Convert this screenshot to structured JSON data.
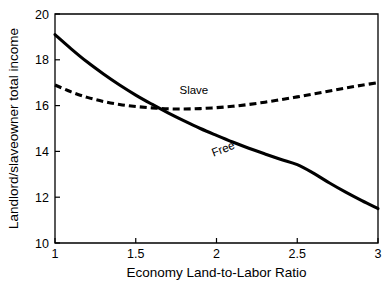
{
  "chart_data": {
    "type": "line",
    "title": "",
    "xlabel": "Economy Land-to-Labor Ratio",
    "ylabel": "Landlord/slaveowner total income",
    "xlim": [
      1,
      3
    ],
    "ylim": [
      10,
      20
    ],
    "xticks": [
      1,
      1.5,
      2,
      2.5,
      3
    ],
    "xticklabels": [
      "1",
      "1.5",
      "2",
      "2.5",
      "3"
    ],
    "yticks": [
      10,
      12,
      14,
      16,
      18,
      20
    ],
    "yticklabels": [
      "10",
      "12",
      "14",
      "16",
      "18",
      "20"
    ],
    "grid": false,
    "legend": "inline-annotations",
    "x": [
      1.0,
      1.1,
      1.2,
      1.3,
      1.4,
      1.5,
      1.6,
      1.7,
      1.8,
      1.9,
      2.0,
      2.1,
      2.2,
      2.3,
      2.4,
      2.5,
      2.6,
      2.7,
      2.8,
      2.9,
      3.0
    ],
    "series": [
      {
        "name": "Free",
        "style": "solid",
        "color": "#000000",
        "label_x": 2.05,
        "label_y": 13.95,
        "label_rotation": -21,
        "values": [
          19.1,
          18.48,
          17.9,
          17.38,
          16.9,
          16.46,
          16.06,
          15.68,
          15.33,
          15.0,
          14.7,
          14.41,
          14.14,
          13.89,
          13.65,
          13.42,
          13.05,
          12.62,
          12.22,
          11.85,
          11.5
        ]
      },
      {
        "name": "Slave",
        "style": "dashed",
        "color": "#000000",
        "label_x": 1.86,
        "label_y": 16.52,
        "label_rotation": 0,
        "values": [
          16.9,
          16.6,
          16.36,
          16.18,
          16.05,
          15.96,
          15.9,
          15.86,
          15.85,
          15.87,
          15.91,
          15.97,
          16.05,
          16.15,
          16.26,
          16.38,
          16.51,
          16.64,
          16.77,
          16.89,
          17.0
        ]
      }
    ],
    "annotations": [
      {
        "text": "Slave",
        "x": 1.86,
        "y": 16.52
      },
      {
        "text": "Free",
        "x": 2.05,
        "y": 13.95
      }
    ]
  },
  "plot_geometry": {
    "left": 55,
    "right": 378,
    "top": 14,
    "bottom": 243
  }
}
